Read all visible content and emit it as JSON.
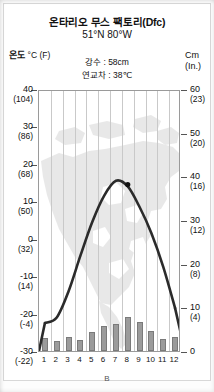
{
  "header": {
    "title": "온타리오 무스 팩토리(Dfc)",
    "coordinates": "51°N 80°W",
    "precipitation_note": "강수 : 58cm",
    "annual_range_note": "연교차 : 38℃"
  },
  "axes": {
    "left_caption_main": "온도",
    "left_caption_sub": "°C (F)",
    "right_caption_main": "Cm",
    "right_caption_sub": "(In.)"
  },
  "figure_label": "B",
  "colors": {
    "bar_fill": "#9b9b9b",
    "bar_stroke": "#7a7a7a",
    "temp_line": "#2b2b2b",
    "grid": "#c9c9c9",
    "frame": "#9a9a9a",
    "map_watermark": "#b6b6b6"
  },
  "chart_data": {
    "type": "bar",
    "title": "온타리오 무스 팩토리(Dfc)",
    "subtitle": "51°N 80°W",
    "xlabel": "",
    "ylabel": "온도 °C (F)",
    "y2label": "Cm (In.)",
    "grid": true,
    "legend": "none",
    "categories": [
      "1",
      "2",
      "3",
      "4",
      "5",
      "6",
      "7",
      "8",
      "9",
      "10",
      "11",
      "12"
    ],
    "ylim": [
      -30,
      40
    ],
    "y2lim": [
      0,
      60
    ],
    "yticks": [
      40,
      30,
      20,
      10,
      0,
      -10,
      -20,
      -30
    ],
    "ytick_labels": [
      "40",
      "30",
      "20",
      "10",
      "0",
      "-10",
      "-20",
      "-30"
    ],
    "ytick_labels_fahrenheit": [
      "(104)",
      "(86)",
      "(68)",
      "(50)",
      "(32)",
      "(14)",
      "(-4)",
      "(-22)"
    ],
    "y2ticks": [
      60,
      50,
      40,
      30,
      20,
      10,
      0
    ],
    "y2tick_labels": [
      "60",
      "50",
      "40",
      "30",
      "20",
      "10",
      "0"
    ],
    "y2tick_labels_inches": [
      "(23)",
      "(20)",
      "(16)",
      "(12)",
      "(8)",
      "(4)",
      ""
    ],
    "series": [
      {
        "name": "강수량",
        "type": "bar",
        "axis": "y2",
        "unit": "cm",
        "values": [
          3.0,
          2.2,
          3.3,
          2.5,
          4.4,
          5.8,
          6.1,
          7.7,
          6.6,
          4.6,
          2.8,
          3.1
        ]
      },
      {
        "name": "기온",
        "type": "line",
        "axis": "y",
        "unit": "°C",
        "values": [
          -22.0,
          -20.5,
          -13.5,
          -4.0,
          5.0,
          12.0,
          16.0,
          14.5,
          9.0,
          2.0,
          -7.0,
          -18.0
        ]
      }
    ],
    "annotations": [
      {
        "name": "location-dot",
        "label": "",
        "month": 8,
        "temp": 15.0
      }
    ]
  }
}
